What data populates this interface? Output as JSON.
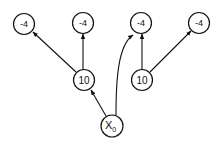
{
  "diagram": {
    "type": "tree-graph",
    "nodes": [
      {
        "id": "leaf1",
        "label": "-4",
        "x": 24,
        "y": 24
      },
      {
        "id": "leaf2",
        "label": "-4",
        "x": 83,
        "y": 23
      },
      {
        "id": "leaf3",
        "label": "-4",
        "x": 141,
        "y": 23
      },
      {
        "id": "leaf4",
        "label": "-4",
        "x": 199,
        "y": 23
      },
      {
        "id": "mid1",
        "label": "10",
        "x": 84,
        "y": 80
      },
      {
        "id": "mid2",
        "label": "10",
        "x": 142,
        "y": 80
      },
      {
        "id": "root",
        "label": "X",
        "subscript": "0",
        "x": 112,
        "y": 126
      }
    ],
    "edges": [
      {
        "from": "root",
        "to": "mid1",
        "style": "straight"
      },
      {
        "from": "root",
        "to": "leaf3",
        "style": "curved"
      },
      {
        "from": "mid1",
        "to": "leaf1",
        "style": "straight"
      },
      {
        "from": "mid1",
        "to": "leaf2",
        "style": "straight"
      },
      {
        "from": "mid2",
        "to": "leaf3",
        "style": "straight"
      },
      {
        "from": "mid2",
        "to": "leaf4",
        "style": "straight"
      }
    ]
  },
  "labels": {
    "leaf1": "-4",
    "leaf2": "-4",
    "leaf3": "-4",
    "leaf4": "-4",
    "mid1": "10",
    "mid2": "10",
    "root_main": "X",
    "root_sub": "0"
  }
}
